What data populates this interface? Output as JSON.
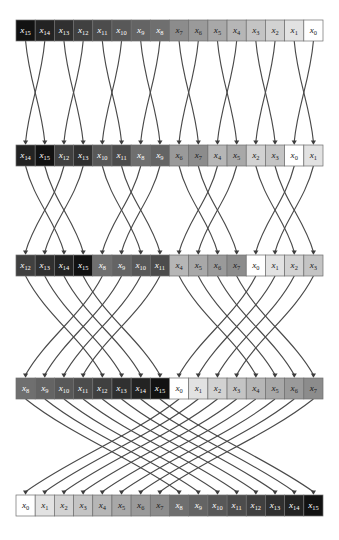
{
  "figure": {
    "type": "permutation-network-diagram",
    "name": "bit-reversal permutation network",
    "background_color": "#ffffff",
    "edge_color": "#4a4a4a",
    "cell_border_color": "#6e6e6e"
  },
  "layout": {
    "canvas_width": 339,
    "canvas_height": 540,
    "row_left": 16,
    "row_right": 323,
    "cell_count": 16,
    "cell_height": 21,
    "row_y": [
      20,
      145,
      255,
      378,
      495
    ]
  },
  "shading": {
    "description": "cell fill is a monotonic gray ramp keyed to the subscript index: index 0 is white, index 15 is near black",
    "by_index": [
      "#ffffff",
      "#e2e2e2",
      "#d2d2d2",
      "#c4c4c4",
      "#b6b6b6",
      "#a8a8a8",
      "#9a9a9a",
      "#8c8c8c",
      "#6f6f6f",
      "#646464",
      "#585858",
      "#4c4c4c",
      "#404040",
      "#303030",
      "#232323",
      "#121212"
    ],
    "light_text_threshold": 8,
    "dark_text_color": "#1a1a1a",
    "light_text_color": "#ffffff"
  },
  "symbol": {
    "base": "x",
    "subscripts": [
      0,
      1,
      2,
      3,
      4,
      5,
      6,
      7,
      8,
      9,
      10,
      11,
      12,
      13,
      14,
      15
    ]
  },
  "rows": [
    {
      "name": "row-input",
      "index": 0,
      "values": [
        15,
        14,
        13,
        12,
        11,
        10,
        9,
        8,
        7,
        6,
        5,
        4,
        3,
        2,
        1,
        0
      ]
    },
    {
      "name": "row-after-stage-1",
      "index": 1,
      "values": [
        14,
        15,
        12,
        13,
        10,
        11,
        8,
        9,
        6,
        7,
        4,
        5,
        2,
        3,
        0,
        1
      ]
    },
    {
      "name": "row-after-stage-2",
      "index": 2,
      "values": [
        12,
        13,
        14,
        15,
        8,
        9,
        10,
        11,
        4,
        5,
        6,
        7,
        0,
        1,
        2,
        3
      ]
    },
    {
      "name": "row-after-stage-3",
      "index": 3,
      "values": [
        8,
        9,
        10,
        11,
        12,
        13,
        14,
        15,
        0,
        1,
        2,
        3,
        4,
        5,
        6,
        7
      ]
    },
    {
      "name": "row-output",
      "index": 4,
      "values": [
        0,
        1,
        2,
        3,
        4,
        5,
        6,
        7,
        8,
        9,
        10,
        11,
        12,
        13,
        14,
        15
      ]
    }
  ],
  "stages": [
    {
      "name": "stage-1",
      "from_row": 0,
      "to_row": 1,
      "swap_distance": 1,
      "block_size": 2,
      "bow": 0.18
    },
    {
      "name": "stage-2",
      "from_row": 1,
      "to_row": 2,
      "swap_distance": 2,
      "block_size": 4,
      "bow": 0.22
    },
    {
      "name": "stage-3",
      "from_row": 2,
      "to_row": 3,
      "swap_distance": 4,
      "block_size": 8,
      "bow": 0.26
    },
    {
      "name": "stage-4",
      "from_row": 3,
      "to_row": 4,
      "swap_distance": 8,
      "block_size": 16,
      "bow": 0.3
    }
  ]
}
